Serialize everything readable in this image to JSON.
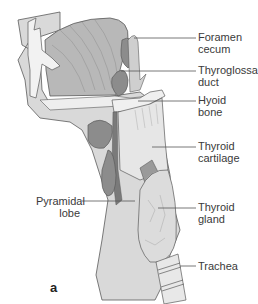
{
  "figure": {
    "panel_letter": "a",
    "top_caption_cropped": "…………………………………………………………",
    "colors": {
      "background": "#ffffff",
      "tissue_light": "#d9d9d9",
      "tissue_mid": "#c4c4c4",
      "tongue": "#b8b8b8",
      "duct_dark": "#8c8c8c",
      "cartilage": "#e6e6e6",
      "outline": "#5a5a5a",
      "leader_line": "#555555"
    }
  },
  "labels": {
    "foramen_cecum": "Foramen\ncecum",
    "thyroglossal_duct": "Thyroglossal\nduct",
    "hyoid_bone": "Hyoid\nbone",
    "thyroid_cartilage": "Thyroid\ncartilage",
    "pyramidal_lobe": "Pyramidal\nlobe",
    "thyroid_gland": "Thyroid\ngland",
    "trachea": "Trachea"
  }
}
